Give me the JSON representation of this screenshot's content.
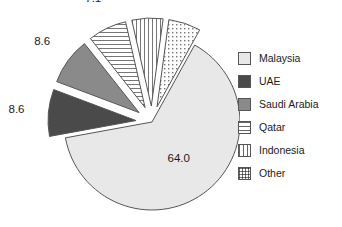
{
  "chart_data": {
    "type": "pie",
    "title": "",
    "subtitle": "",
    "xlabel": "",
    "ylabel": "",
    "grid": false,
    "legend_position": "right",
    "value_suffix": "",
    "total": 99.9,
    "categories": [
      "Malaysia",
      "UAE",
      "Saudi Arabia",
      "Qatar",
      "Indonesia",
      "Other"
    ],
    "values": [
      64.0,
      8.6,
      8.6,
      7.1,
      5.7,
      5.9
    ],
    "labels": [
      "64.0",
      "8.6",
      "8.6",
      "7.1",
      "5.7",
      "5.9"
    ],
    "slices": [
      {
        "name": "Malaysia",
        "value": 64.0,
        "label": "64.0",
        "color": "#e8e8e8",
        "pattern": "solid-light",
        "exploded": false
      },
      {
        "name": "UAE",
        "value": 8.6,
        "label": "8.6",
        "color": "#4a4a4a",
        "pattern": "solid-dark",
        "exploded": true
      },
      {
        "name": "Saudi Arabia",
        "value": 8.6,
        "label": "8.6",
        "color": "#8a8a8a",
        "pattern": "solid-medium",
        "exploded": true
      },
      {
        "name": "Qatar",
        "value": 7.1,
        "label": "7.1",
        "color": "#ffffff",
        "pattern": "horizontal-lines",
        "exploded": true
      },
      {
        "name": "Indonesia",
        "value": 5.7,
        "label": "5.7",
        "color": "#ffffff",
        "pattern": "vertical-lines",
        "exploded": true
      },
      {
        "name": "Other",
        "value": 5.9,
        "label": "5.9",
        "color": "#ffffff",
        "pattern": "dotted-grid",
        "exploded": true
      }
    ],
    "legend": [
      {
        "label": "Malaysia",
        "pattern": "solid-light",
        "color": "#e8e8e8"
      },
      {
        "label": "UAE",
        "pattern": "solid-dark",
        "color": "#4a4a4a"
      },
      {
        "label": "Saudi Arabia",
        "pattern": "solid-medium",
        "color": "#8a8a8a"
      },
      {
        "label": "Qatar",
        "pattern": "horizontal-lines",
        "color": "#ffffff"
      },
      {
        "label": "Indonesia",
        "pattern": "vertical-lines",
        "color": "#ffffff"
      },
      {
        "label": "Other",
        "pattern": "dotted-grid",
        "color": "#ffffff"
      }
    ],
    "style": {
      "background": "#ffffff",
      "outline": "#555555",
      "text": "#1a1a1a"
    }
  }
}
